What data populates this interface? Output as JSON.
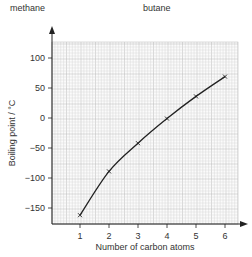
{
  "labels": {
    "top_left": "methane",
    "top_right": "butane"
  },
  "chart_data": {
    "type": "line",
    "title": "",
    "xlabel": "Number of carbon atoms",
    "ylabel": "Boiling point / °C",
    "x": [
      1,
      2,
      3,
      4,
      5,
      6
    ],
    "series": [
      {
        "name": "Boiling point of alkanes",
        "values": [
          -162,
          -89,
          -42,
          -1,
          36,
          69
        ],
        "marker": "x"
      }
    ],
    "xticks": [
      1,
      2,
      3,
      4,
      5,
      6
    ],
    "yticks": [
      100,
      50,
      0,
      -50,
      -100,
      -150
    ],
    "xlim": [
      0,
      6.5
    ],
    "ylim": [
      -175,
      125
    ],
    "grid": true,
    "legend": "none",
    "annotations": [
      "methane",
      "butane"
    ]
  },
  "colors": {
    "grid_minor": "#d9d9d9",
    "grid_major": "#b8b8b8",
    "line": "#222222",
    "axis": "#222222"
  }
}
